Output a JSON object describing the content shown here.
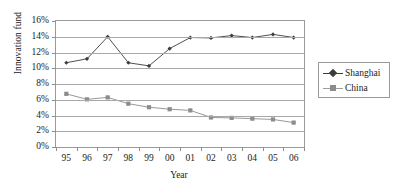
{
  "chart_data": {
    "type": "line",
    "title": "",
    "xlabel": "Year",
    "ylabel": "Innovation fund",
    "categories": [
      "95",
      "96",
      "97",
      "98",
      "99",
      "00",
      "01",
      "02",
      "03",
      "04",
      "05",
      "06"
    ],
    "ylim": [
      0,
      16
    ],
    "ytick_step": 2,
    "ytick_labels": [
      "0%",
      "2%",
      "4%",
      "6%",
      "8%",
      "10%",
      "12%",
      "14%",
      "16%"
    ],
    "yunit": "%",
    "grid": true,
    "legend_position": "right",
    "series": [
      {
        "name": "Shanghai",
        "marker": "diamond",
        "color": "#3c3c3c",
        "values": [
          10.7,
          11.2,
          14.0,
          10.7,
          10.3,
          12.5,
          13.9,
          13.85,
          14.15,
          13.9,
          14.3,
          13.9
        ]
      },
      {
        "name": "China",
        "marker": "square",
        "color": "#8c8c8c",
        "values": [
          6.75,
          6.05,
          6.3,
          5.5,
          5.05,
          4.8,
          4.65,
          3.75,
          3.7,
          3.6,
          3.5,
          3.1
        ]
      }
    ]
  },
  "legend": {
    "items": [
      {
        "label": "Shanghai"
      },
      {
        "label": "China"
      }
    ]
  },
  "axes": {
    "y_title": "Innovation fund",
    "x_title": "Year"
  },
  "colors": {
    "shanghai": "#3c3c3c",
    "china": "#8c8c8c",
    "grid": "#a8a8a8",
    "frame": "#9a9a9a",
    "background": "#ffffff"
  }
}
